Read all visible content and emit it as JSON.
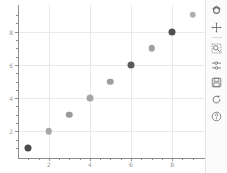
{
  "chart_data": {
    "type": "scatter",
    "title": "",
    "xlabel": "",
    "ylabel": "",
    "x": [
      1,
      2,
      3,
      4,
      5,
      6,
      7,
      8,
      9
    ],
    "y": [
      1,
      2,
      3,
      4,
      5,
      6,
      7,
      8,
      9
    ],
    "point_colors": [
      "#4a4a4a",
      "#a6a6a6",
      "#9a9a9a",
      "#a6a6a6",
      "#9e9e9e",
      "#5a5a5a",
      "#a0a0a0",
      "#4f4f4f",
      "#b0b0b0"
    ],
    "point_sizes": [
      7,
      6.5,
      6.5,
      7,
      6.5,
      7,
      6.5,
      7,
      6.5
    ],
    "xlim": [
      0.5,
      9.6
    ],
    "ylim": [
      0.4,
      9.6
    ],
    "xticks": [
      2,
      4,
      6,
      8
    ],
    "xticklabels": [
      "2",
      "4",
      "6",
      "8"
    ],
    "yticks": [
      2,
      4,
      6,
      8
    ],
    "yticklabels": [
      "2",
      "4",
      "6",
      "8"
    ],
    "xminorticks": [
      1,
      1.5,
      2.5,
      3,
      3.5,
      4.5,
      5,
      5.5,
      6.5,
      7,
      7.5,
      8.5,
      9
    ],
    "yminorticks": [
      1,
      1.5,
      2.5,
      3,
      3.5,
      4.5,
      5,
      5.5,
      6.5,
      7,
      7.5,
      8.5,
      9
    ],
    "grid": true,
    "grid_color": "#e9e9e9",
    "legend": null,
    "background": "#ffffff"
  },
  "toolbar": {
    "buttons": [
      {
        "name": "home-icon",
        "label": "Reset original view"
      },
      {
        "name": "move-icon",
        "label": "Pan axes with left mouse, zoom with right"
      },
      {
        "name": "zoom-rect-icon",
        "label": "Zoom to rectangle"
      },
      {
        "name": "subplots-config-icon",
        "label": "Configure subplots"
      },
      {
        "name": "save-icon",
        "label": "Save the figure"
      },
      {
        "name": "refresh-icon",
        "label": "Refresh"
      },
      {
        "name": "help-icon",
        "label": "Help"
      }
    ]
  },
  "colors": {
    "axis": "#8d8d8d",
    "grid": "#e9e9e9",
    "ticklabel": "#9a9a9a",
    "toolbar_bg": "#fbfbfb",
    "toolbar_icon": "#6f6f6f"
  }
}
